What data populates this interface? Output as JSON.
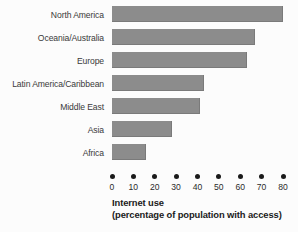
{
  "chart_data": {
    "type": "bar",
    "orientation": "horizontal",
    "title": "",
    "xlabel": "Internet use (percentage of population with access)",
    "ylabel": "",
    "xlim": [
      0,
      80
    ],
    "grid": false,
    "legend": "none",
    "bar_color": "#8c8c8c",
    "background_color": "#fcfcfc",
    "categories": [
      "North America",
      "Oceania/Australia",
      "Europe",
      "Latin America/Caribbean",
      "Middle East",
      "Asia",
      "Africa"
    ],
    "values": [
      80,
      67,
      63,
      43,
      41,
      28,
      16
    ],
    "xticks": [
      0,
      10,
      20,
      30,
      40,
      50,
      60,
      70,
      80
    ],
    "xtick_labels": [
      "0",
      "10",
      "20",
      "30",
      "40",
      "50",
      "60",
      "70",
      "80"
    ]
  },
  "axis_title": {
    "line1": "Internet use",
    "line2": "(percentage of population with access)"
  }
}
